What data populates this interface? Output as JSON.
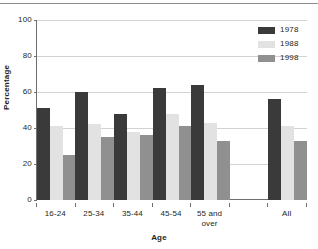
{
  "chart_data": {
    "type": "bar",
    "title": "",
    "xlabel": "Age",
    "ylabel": "Percentage",
    "ylim": [
      0,
      100
    ],
    "yticks": [
      0,
      20,
      40,
      60,
      80,
      100
    ],
    "ytick_labels": [
      "0",
      "20",
      "40",
      "60",
      "80",
      "100"
    ],
    "grid": true,
    "legend_position": "top-right",
    "categories": [
      "16-24",
      "25-34",
      "35-44",
      "45-54",
      "55 and\nover",
      "",
      "All"
    ],
    "series": [
      {
        "name": "1978",
        "color": "#3a3a3a",
        "values": [
          51,
          60,
          48,
          62,
          64,
          null,
          56
        ]
      },
      {
        "name": "1988",
        "color": "#e2e2e2",
        "values": [
          41,
          42,
          38,
          48,
          43,
          null,
          41
        ]
      },
      {
        "name": "1998",
        "color": "#909090",
        "values": [
          25,
          35,
          36,
          41,
          33,
          null,
          33
        ]
      }
    ]
  }
}
